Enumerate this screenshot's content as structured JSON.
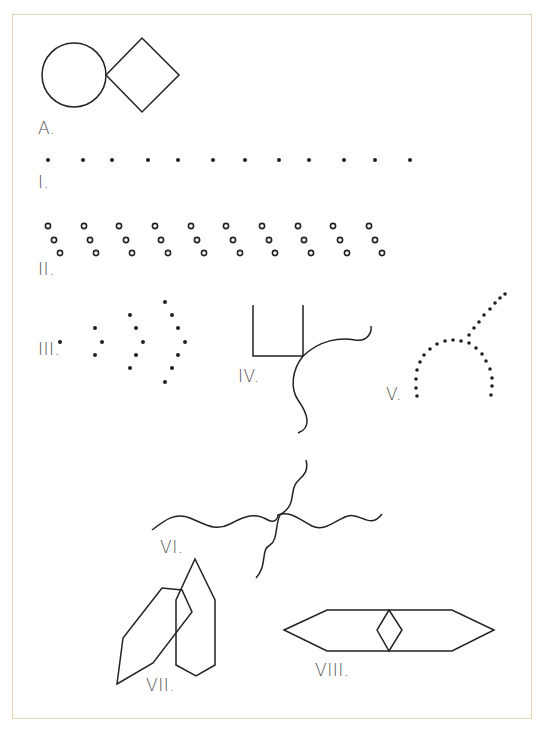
{
  "figure": {
    "frame_color": "#e8d4b8",
    "stroke_color": "#222222",
    "label_color": "#555555"
  },
  "items": {
    "A": {
      "label": "A.",
      "description": "circle touching a diamond"
    },
    "I": {
      "label": "I.",
      "description": "row of 12 evenly spaced dots"
    },
    "II": {
      "label": "II.",
      "description": "10 diagonal groups of three small circles"
    },
    "III": {
      "label": "III.",
      "description": "nested chevrons of dots (1, 3, 5, 7 dots)"
    },
    "IV": {
      "label": "IV.",
      "description": "open-top rectangle with wavy line crossing its corner"
    },
    "V": {
      "label": "V.",
      "description": "dotted arc with dotted straight line branching"
    },
    "VI": {
      "label": "VI.",
      "description": "two crossing wavy lines"
    },
    "VII": {
      "label": "VII.",
      "description": "two overlapping elongated hexagons"
    },
    "VIII": {
      "label": "VIII.",
      "description": "elongated horizontal hexagon with small diamond at center"
    }
  }
}
